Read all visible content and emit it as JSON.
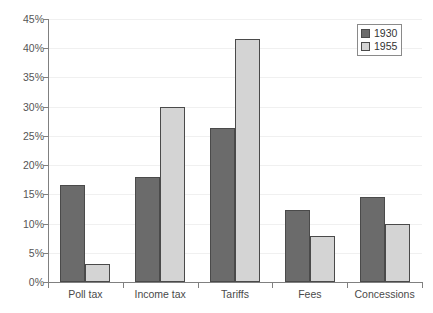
{
  "chart_data": {
    "type": "bar",
    "title": "",
    "subtitle": "",
    "xlabel": "",
    "ylabel": "",
    "categories": [
      "Poll tax",
      "Income tax",
      "Tariffs",
      "Fees",
      "Concessions"
    ],
    "series": [
      {
        "name": "1930",
        "color": "#6b6b6b",
        "values": [
          16.6,
          18.0,
          26.4,
          12.3,
          14.5
        ]
      },
      {
        "name": "1955",
        "color": "#d4d4d4",
        "values": [
          3.1,
          30.0,
          41.5,
          7.9,
          9.9
        ]
      }
    ],
    "ylim": [
      0,
      45
    ],
    "ytick_values": [
      0,
      5,
      10,
      15,
      20,
      25,
      30,
      35,
      40,
      45
    ],
    "ytick_labels": [
      "0%",
      "5%",
      "10%",
      "15%",
      "20%",
      "25%",
      "30%",
      "35%",
      "40%",
      "45%"
    ],
    "grid": true,
    "grid_axis": "y",
    "legend_position": "top-right",
    "legend_entries": [
      "1930",
      "1955"
    ],
    "annotations": []
  },
  "legend": {
    "entries": [
      {
        "label": "1930"
      },
      {
        "label": "1955"
      }
    ]
  }
}
